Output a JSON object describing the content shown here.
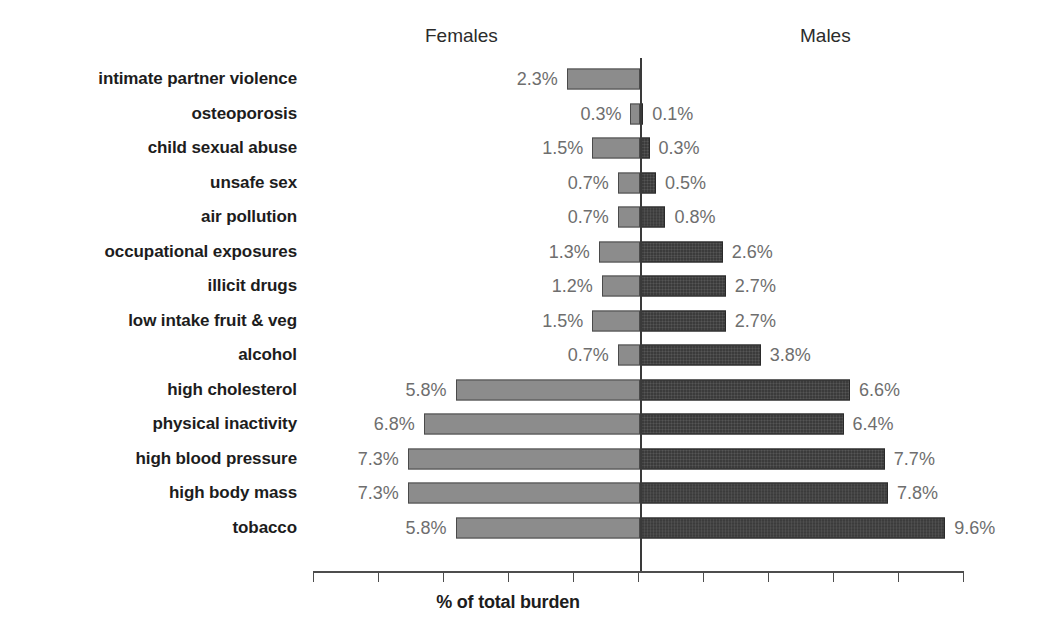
{
  "meta": {
    "clipped_title": "",
    "background": "#ffffff"
  },
  "header": {
    "females_label": "Females",
    "males_label": "Males"
  },
  "axis": {
    "x_title": "% of total burden",
    "tick_count": 11,
    "tick_spacing_px": 65,
    "first_tick_x": 313,
    "zero_line_x": 640,
    "px_per_percent": 31.8,
    "tick_labels": []
  },
  "colors": {
    "female_bar": "#8c8c8c",
    "female_bar_border": "#4a4a4a",
    "male_bar": "#3b3b3b",
    "male_bar_border": "#2a2a2a",
    "value_text": "#6e6e6e",
    "category_text": "#1d1d1d",
    "axis_line": "#4d4d4d",
    "zero_line": "#3a3a3a"
  },
  "chart_data": {
    "type": "bar",
    "subtype": "diverging-population-pyramid",
    "title": "",
    "xlabel": "% of total burden",
    "ylabel": "",
    "grid": false,
    "legend_position": "top",
    "orientation": "horizontal",
    "xlim": [
      -8,
      10
    ],
    "categories": [
      "intimate partner violence",
      "osteoporosis",
      "child sexual abuse",
      "unsafe sex",
      "air pollution",
      "occupational exposures",
      "illicit drugs",
      "low intake fruit & veg",
      "alcohol",
      "high cholesterol",
      "physical inactivity",
      "high blood pressure",
      "high body mass",
      "tobacco"
    ],
    "series": [
      {
        "name": "Females",
        "side": "left",
        "color": "#8c8c8c",
        "values": [
          2.3,
          0.3,
          1.5,
          0.7,
          0.7,
          1.3,
          1.2,
          1.5,
          0.7,
          5.8,
          6.8,
          7.3,
          7.3,
          5.8
        ],
        "labels": [
          "2.3%",
          "0.3%",
          "1.5%",
          "0.7%",
          "0.7%",
          "1.3%",
          "1.2%",
          "1.5%",
          "0.7%",
          "5.8%",
          "6.8%",
          "7.3%",
          "7.3%",
          "5.8%"
        ]
      },
      {
        "name": "Males",
        "side": "right",
        "color": "#3b3b3b",
        "values": [
          0,
          0.1,
          0.3,
          0.5,
          0.8,
          2.6,
          2.7,
          2.7,
          3.8,
          6.6,
          6.4,
          7.7,
          7.8,
          9.6
        ],
        "labels": [
          "",
          "0.1%",
          "0.3%",
          "0.5%",
          "0.8%",
          "2.6%",
          "2.7%",
          "2.7%",
          "3.8%",
          "6.6%",
          "6.4%",
          "7.7%",
          "7.8%",
          "9.6%"
        ]
      }
    ]
  },
  "rows": [
    {
      "category": "intimate partner violence",
      "female": 2.3,
      "female_label": "2.3%",
      "male": 0,
      "male_label": ""
    },
    {
      "category": "osteoporosis",
      "female": 0.3,
      "female_label": "0.3%",
      "male": 0.1,
      "male_label": "0.1%"
    },
    {
      "category": "child sexual abuse",
      "female": 1.5,
      "female_label": "1.5%",
      "male": 0.3,
      "male_label": "0.3%"
    },
    {
      "category": "unsafe sex",
      "female": 0.7,
      "female_label": "0.7%",
      "male": 0.5,
      "male_label": "0.5%"
    },
    {
      "category": "air pollution",
      "female": 0.7,
      "female_label": "0.7%",
      "male": 0.8,
      "male_label": "0.8%"
    },
    {
      "category": "occupational exposures",
      "female": 1.3,
      "female_label": "1.3%",
      "male": 2.6,
      "male_label": "2.6%"
    },
    {
      "category": "illicit drugs",
      "female": 1.2,
      "female_label": "1.2%",
      "male": 2.7,
      "male_label": "2.7%"
    },
    {
      "category": "low intake fruit & veg",
      "female": 1.5,
      "female_label": "1.5%",
      "male": 2.7,
      "male_label": "2.7%"
    },
    {
      "category": "alcohol",
      "female": 0.7,
      "female_label": "0.7%",
      "male": 3.8,
      "male_label": "3.8%"
    },
    {
      "category": "high cholesterol",
      "female": 5.8,
      "female_label": "5.8%",
      "male": 6.6,
      "male_label": "6.6%"
    },
    {
      "category": "physical inactivity",
      "female": 6.8,
      "female_label": "6.8%",
      "male": 6.4,
      "male_label": "6.4%"
    },
    {
      "category": "high blood pressure",
      "female": 7.3,
      "female_label": "7.3%",
      "male": 7.7,
      "male_label": "7.7%"
    },
    {
      "category": "high body mass",
      "female": 7.3,
      "female_label": "7.3%",
      "male": 7.8,
      "male_label": "7.8%"
    },
    {
      "category": "tobacco",
      "female": 5.8,
      "female_label": "5.8%",
      "male": 9.6,
      "male_label": "9.6%"
    }
  ]
}
